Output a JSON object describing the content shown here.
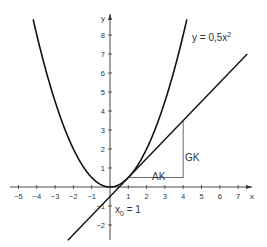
{
  "chart_data": {
    "type": "line",
    "title": "",
    "xlabel": "x",
    "ylabel": "y",
    "xlim": [
      -5.3,
      7.6
    ],
    "ylim": [
      -2.7,
      9
    ],
    "grid": false,
    "x_ticks": [
      -5,
      -4,
      -3,
      -2,
      -1,
      1,
      2,
      3,
      4,
      5,
      6,
      7
    ],
    "y_ticks": [
      -2,
      -1,
      1,
      2,
      3,
      4,
      5,
      6,
      7,
      8
    ],
    "series": [
      {
        "name": "y = 0,5x²",
        "kind": "parabola",
        "formula": "0.5*x^2",
        "x_range": [
          -4.2,
          4.2
        ]
      },
      {
        "name": "tangent",
        "kind": "line",
        "formula": "x - 0.5",
        "x_range": [
          -2.3,
          7.5
        ]
      }
    ],
    "annotations": [
      {
        "text": "y = 0,5x²",
        "x": 4.4,
        "y": 8
      },
      {
        "text": "AK",
        "x": 2.5,
        "y": 0.4,
        "note": "horizontal leg of slope triangle (Ankathete)"
      },
      {
        "text": "GK",
        "x": 4.3,
        "y": 1.9,
        "note": "vertical leg of slope triangle (Gegenkathete)"
      },
      {
        "text": "x₀ = 1",
        "x": 0.3,
        "y": -1.2
      }
    ],
    "slope_triangle": {
      "from": [
        1,
        0.5
      ],
      "to_x": 4,
      "to_y": 3.5
    }
  },
  "labels": {
    "x_axis": "x",
    "y_axis": "y",
    "curve_label_main": "y = 0,5x",
    "curve_label_exp": "2",
    "ak": "AK",
    "gk": "GK",
    "x0_main": "x",
    "x0_sub": "0",
    "x0_rest": " = 1"
  }
}
